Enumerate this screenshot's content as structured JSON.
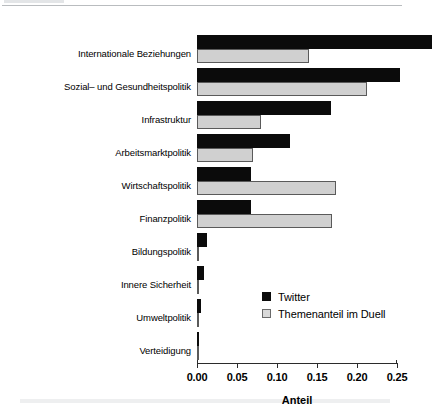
{
  "chart_data": {
    "type": "bar",
    "orientation": "horizontal",
    "title": "",
    "subtitle": "",
    "xlabel": "Anteil",
    "ylabel": "",
    "xlim": [
      0,
      0.29375
    ],
    "xticks": [
      0.0,
      0.05,
      0.1,
      0.15,
      0.2,
      0.25
    ],
    "xtick_labels": [
      "0.00",
      "0.05",
      "0.10",
      "0.15",
      "0.20",
      "0.25"
    ],
    "grid": false,
    "legend_position": "center-right",
    "categories": [
      "Internationale Beziehungen",
      "Sozial– und Gesundheitspolitik",
      "Infrastruktur",
      "Arbeitsmarktpolitik",
      "Wirtschaftspolitik",
      "Finanzpolitik",
      "Bildungspolitik",
      "Innere Sicherheit",
      "Umweltpolitik",
      "Verteidigung"
    ],
    "series": [
      {
        "name": "Twitter",
        "color": "#0b0b0b",
        "values": [
          0.294,
          0.254,
          0.1675,
          0.116,
          0.068,
          0.068,
          0.0125,
          0.009,
          0.005,
          0.0025
        ]
      },
      {
        "name": "Themenanteil im Duell",
        "color": "#d0d0d0",
        "values": [
          0.14,
          0.2125,
          0.08,
          0.07,
          0.174,
          0.169,
          0.001,
          0.001,
          0.001,
          0.001
        ]
      }
    ]
  },
  "axis": {
    "x_title": "Anteil"
  },
  "legend": {
    "entries": [
      {
        "label": "Twitter",
        "swatch": "black-square-icon"
      },
      {
        "label": "Themenanteil im Duell",
        "swatch": "gray-square-icon"
      }
    ]
  }
}
